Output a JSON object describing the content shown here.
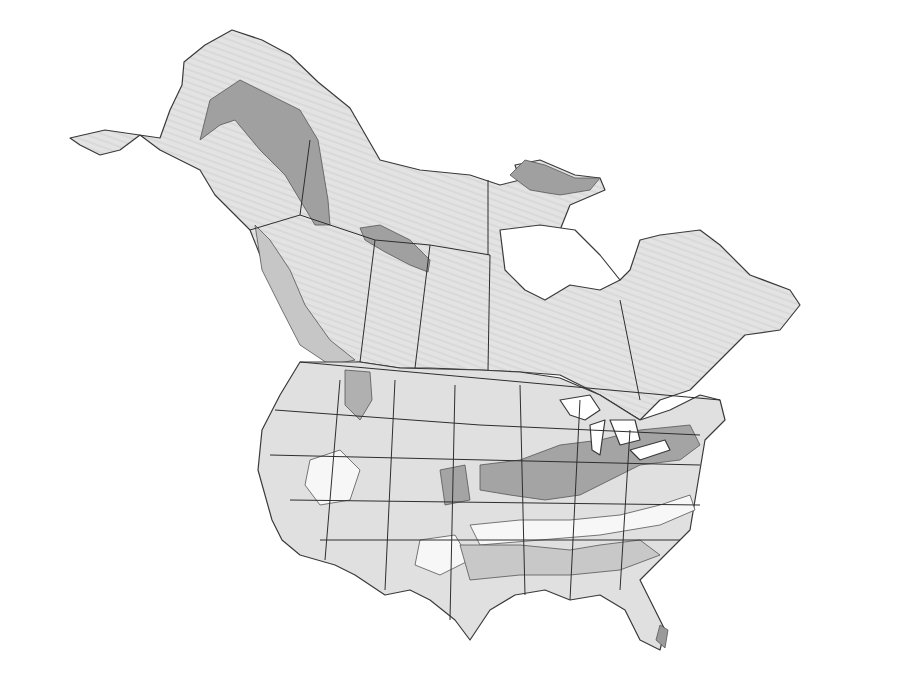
{
  "map": {
    "title": "",
    "region": "North America (Alaska, Canada, contiguous United States)",
    "style": "grayscale shaded zone map",
    "colors": {
      "background": "#ffffff",
      "zone_white": "#f8f8f8",
      "zone_light": "#e2e2e2",
      "zone_medium": "#c4c4c4",
      "zone_dark": "#9a9a9a",
      "border": "#2e2e2e"
    },
    "legend": [],
    "labels": []
  }
}
